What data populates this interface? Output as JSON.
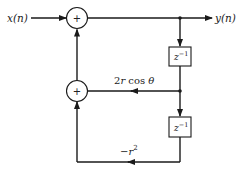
{
  "diagram": {
    "input_label": "x(n)",
    "output_label": "y(n)",
    "adders": [
      {
        "id": "adder-top",
        "symbol": "+"
      },
      {
        "id": "adder-bottom",
        "symbol": "+"
      }
    ],
    "delays": [
      {
        "id": "delay-1",
        "base": "z",
        "exp": "−1"
      },
      {
        "id": "delay-2",
        "base": "z",
        "exp": "−1"
      }
    ],
    "gains": {
      "g1": {
        "prefix": "2",
        "var": "r",
        "func": " cos ",
        "angle": "θ"
      },
      "g2": {
        "sign": "−",
        "var": "r",
        "exp": "2"
      }
    },
    "colors": {
      "line": "#1a1a1a",
      "background": "#ffffff"
    }
  }
}
